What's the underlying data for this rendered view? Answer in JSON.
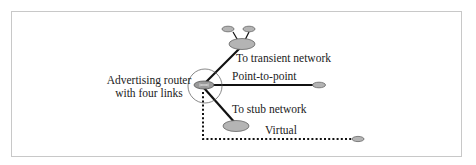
{
  "diagram": {
    "router_label_line1": "Advertising router",
    "router_label_line2": "with four links",
    "links": [
      {
        "type": "transient",
        "label": "To transient network",
        "style": "solid"
      },
      {
        "type": "point-to-point",
        "label": "Point-to-point",
        "style": "solid"
      },
      {
        "type": "stub",
        "label": "To stub network",
        "style": "solid"
      },
      {
        "type": "virtual",
        "label": "Virtual",
        "style": "dotted"
      }
    ],
    "colors": {
      "node_fill": "#b4b4b4",
      "node_stroke": "#666666",
      "line": "#111111",
      "frame": "#c8c8c8"
    }
  }
}
